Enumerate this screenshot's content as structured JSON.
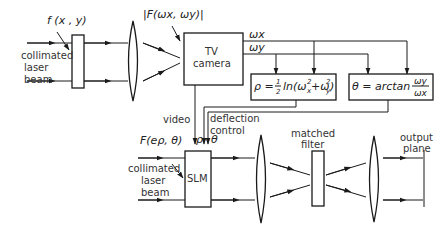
{
  "labels": {
    "input_function": "f (x , y)",
    "collimated_1": "collimated",
    "laser_1": "laser",
    "beam_1": "beam",
    "fourier_mag": "|F(ωx, ωy)|",
    "tv_1": "TV",
    "tv_2": "camera",
    "wx": "ωx",
    "wy": "ωy",
    "rho_eq": "ρ = ½ ln(ωx² + ωy²)",
    "rho_lhs": "ρ =",
    "rho_ln": "ln(ω",
    "theta_eq": "θ = arctan ωy/ωx",
    "theta_lhs": "θ = arctan",
    "theta_num": "ωy",
    "theta_den": "ωx",
    "video": "video",
    "deflection": "deflection",
    "control": "control",
    "rho": "ρ",
    "theta": "θ",
    "slm_input": "F(eρ, θ)",
    "collimated_2": "collimated",
    "laser_2": "laser",
    "beam_2": "beam",
    "slm": "SLM",
    "matched_1": "matched",
    "matched_2": "filter",
    "output_1": "output",
    "output_2": "plane"
  },
  "colors": {
    "line": "#1a1a1a",
    "text": "#333333",
    "background": "#ffffff"
  }
}
